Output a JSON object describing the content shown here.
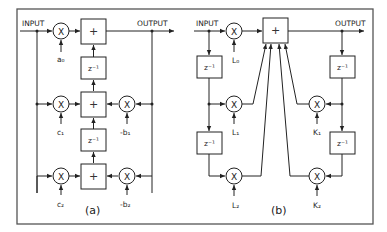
{
  "figure": {
    "panel_a": {
      "caption": "(a)",
      "input_label": "INPUT",
      "output_label": "OUTPUT",
      "multiply_symbol": "X",
      "add_symbol": "+",
      "delay_label": "z⁻¹",
      "coefficients": {
        "a0": "a₀",
        "c1": "c₁",
        "c2": "c₂",
        "b1": "-b₁",
        "b2": "-b₂"
      }
    },
    "panel_b": {
      "caption": "(b)",
      "input_label": "INPUT",
      "output_label": "OUTPUT",
      "multiply_symbol": "X",
      "add_symbol": "+",
      "delay_label": "z⁻¹",
      "coefficients": {
        "L0": "L₀",
        "L1": "L₁",
        "L2": "L₂",
        "K1": "K₁",
        "K2": "K₂"
      }
    }
  }
}
